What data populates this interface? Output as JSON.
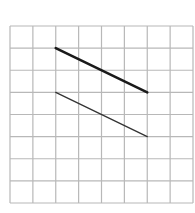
{
  "diagram": {
    "type": "grid-with-segments",
    "grid": {
      "columns": 8,
      "rows": 8,
      "origin_px": [
        10,
        26
      ],
      "cell_w": 22.875,
      "cell_h": 22.125,
      "line_color": "#b8b8b8"
    },
    "segments": [
      {
        "name": "thick-segment",
        "from": [
          2,
          1
        ],
        "to": [
          6,
          3
        ],
        "stroke": "#1a1a1a",
        "width": 2.6
      },
      {
        "name": "thin-segment",
        "from": [
          2,
          3
        ],
        "to": [
          6,
          5
        ],
        "stroke": "#333333",
        "width": 1.3
      }
    ]
  }
}
